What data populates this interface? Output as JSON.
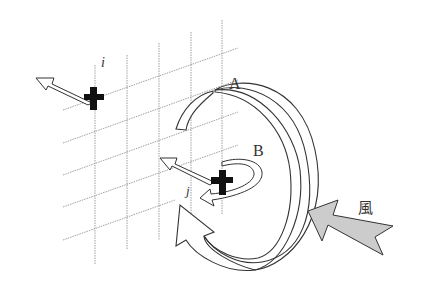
{
  "diagram": {
    "labels": {
      "vortex_large": "A",
      "vortex_small": "B",
      "point_i": "i",
      "point_j": "j",
      "wind": "風"
    },
    "colors": {
      "stroke": "#333333",
      "grid": "#888888",
      "cross": "#111111",
      "wind_fill": "#cccccc",
      "background": "#ffffff"
    },
    "elements": [
      {
        "type": "grid",
        "orientation": "oblique",
        "vertical_lines": 5,
        "oblique_lines": 5
      },
      {
        "type": "vortex",
        "label": "A",
        "size": "large"
      },
      {
        "type": "vortex",
        "label": "B",
        "size": "small"
      },
      {
        "type": "point",
        "label": "i",
        "marker": "cross",
        "arrow": "hollow-left-up"
      },
      {
        "type": "point",
        "label": "j",
        "marker": "cross",
        "arrow": "hollow-left-up"
      },
      {
        "type": "wind-arrow",
        "label": "風",
        "fill": "gray"
      }
    ]
  }
}
